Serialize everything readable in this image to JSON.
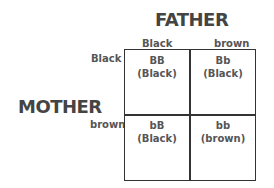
{
  "diagram": {
    "type": "punnett-square",
    "father_label": "FATHER",
    "mother_label": "MOTHER",
    "father_alleles": [
      "Black",
      "brown"
    ],
    "mother_alleles": [
      "Black",
      "brown"
    ],
    "cells": [
      [
        {
          "genotype": "BB",
          "phenotype": "(Black)"
        },
        {
          "genotype": "Bb",
          "phenotype": "(Black)"
        }
      ],
      [
        {
          "genotype": "bB",
          "phenotype": "(Black)"
        },
        {
          "genotype": "bb",
          "phenotype": "(brown)"
        }
      ]
    ]
  }
}
